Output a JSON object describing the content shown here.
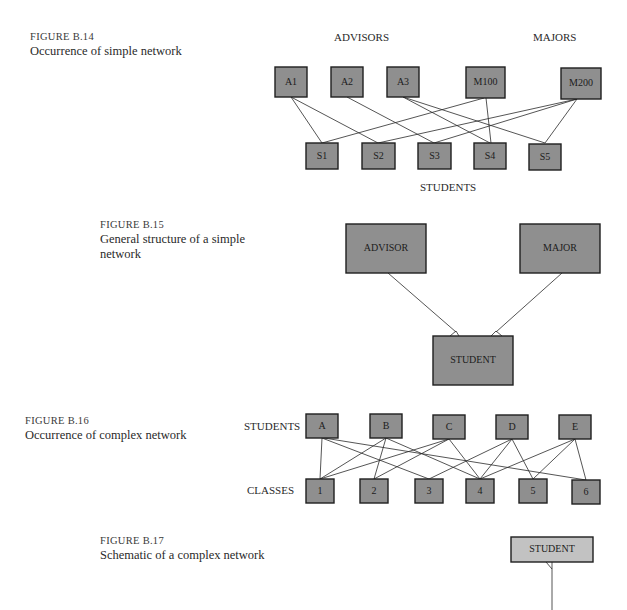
{
  "figures": {
    "b14": {
      "number": "FIGURE B.14",
      "title": "Occurrence of simple network",
      "group_labels": {
        "advisors": "ADVISORS",
        "majors": "MAJORS",
        "students": "STUDENTS"
      },
      "nodes": {
        "A1": "A1",
        "A2": "A2",
        "A3": "A3",
        "M100": "M100",
        "M200": "M200",
        "S1": "S1",
        "S2": "S2",
        "S3": "S3",
        "S4": "S4",
        "S5": "S5"
      }
    },
    "b15": {
      "number": "FIGURE B.15",
      "title_line1": "General structure of a simple",
      "title_line2": "network",
      "nodes": {
        "advisor": "ADVISOR",
        "major": "MAJOR",
        "student": "STUDENT"
      }
    },
    "b16": {
      "number": "FIGURE B.16",
      "title": "Occurrence of complex network",
      "group_labels": {
        "students": "STUDENTS",
        "classes": "CLASSES"
      },
      "nodes": {
        "A": "A",
        "B": "B",
        "C": "C",
        "D": "D",
        "E": "E",
        "c1": "1",
        "c2": "2",
        "c3": "3",
        "c4": "4",
        "c5": "5",
        "c6": "6"
      }
    },
    "b17": {
      "number": "FIGURE B.17",
      "title": "Schematic of a complex network",
      "nodes": {
        "student": "STUDENT"
      }
    }
  },
  "edges": {
    "b14": [
      [
        "A1",
        "S1"
      ],
      [
        "A1",
        "S2"
      ],
      [
        "A2",
        "S3"
      ],
      [
        "A3",
        "S4"
      ],
      [
        "A3",
        "S5"
      ],
      [
        "M100",
        "S1"
      ],
      [
        "M100",
        "S4"
      ],
      [
        "M200",
        "S2"
      ],
      [
        "M200",
        "S3"
      ],
      [
        "M200",
        "S5"
      ]
    ],
    "b15": [
      [
        "ADVISOR",
        "STUDENT"
      ],
      [
        "MAJOR",
        "STUDENT"
      ]
    ],
    "b16": [
      [
        "A",
        "1"
      ],
      [
        "A",
        "3"
      ],
      [
        "A",
        "6"
      ],
      [
        "B",
        "1"
      ],
      [
        "B",
        "2"
      ],
      [
        "B",
        "4"
      ],
      [
        "C",
        "1"
      ],
      [
        "C",
        "2"
      ],
      [
        "C",
        "4"
      ],
      [
        "D",
        "3"
      ],
      [
        "D",
        "4"
      ],
      [
        "D",
        "5"
      ],
      [
        "E",
        "4"
      ],
      [
        "E",
        "5"
      ],
      [
        "E",
        "6"
      ]
    ]
  },
  "colors": {
    "box_fill": "#8f8f8f",
    "box_fill_light": "#c2c2c2",
    "border": "#1e1e1e"
  }
}
